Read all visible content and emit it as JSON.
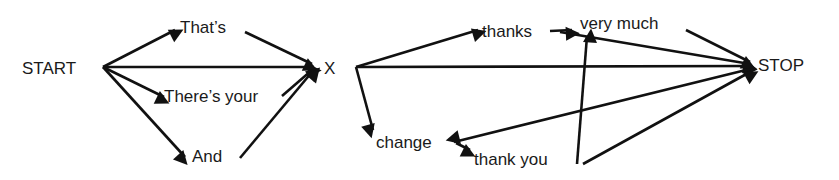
{
  "diagram": {
    "type": "directed-graph",
    "nodes": [
      {
        "id": "start",
        "label": "START"
      },
      {
        "id": "thats",
        "label": "That’s"
      },
      {
        "id": "theres_your",
        "label": "There’s your"
      },
      {
        "id": "and",
        "label": "And"
      },
      {
        "id": "x",
        "label": "X"
      },
      {
        "id": "thanks",
        "label": "thanks"
      },
      {
        "id": "very_much",
        "label": "very much"
      },
      {
        "id": "change",
        "label": "change"
      },
      {
        "id": "thank_you",
        "label": "thank you"
      },
      {
        "id": "stop",
        "label": "STOP"
      }
    ],
    "edges": [
      {
        "from": "start",
        "to": "thats"
      },
      {
        "from": "start",
        "to": "x"
      },
      {
        "from": "start",
        "to": "theres_your"
      },
      {
        "from": "start",
        "to": "and"
      },
      {
        "from": "thats",
        "to": "x"
      },
      {
        "from": "theres_your",
        "to": "x"
      },
      {
        "from": "and",
        "to": "x"
      },
      {
        "from": "x",
        "to": "thanks"
      },
      {
        "from": "x",
        "to": "stop"
      },
      {
        "from": "x",
        "to": "change"
      },
      {
        "from": "thanks",
        "to": "very_much"
      },
      {
        "from": "thanks",
        "to": "stop"
      },
      {
        "from": "very_much",
        "to": "stop"
      },
      {
        "from": "change",
        "to": "thank_you"
      },
      {
        "from": "stop",
        "to": "change"
      },
      {
        "from": "thank_you",
        "to": "very_much"
      },
      {
        "from": "thank_you",
        "to": "stop"
      }
    ]
  }
}
